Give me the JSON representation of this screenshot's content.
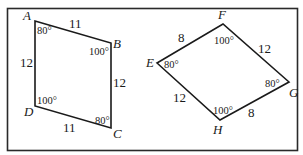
{
  "figure": {
    "colors": {
      "stroke": "#1a1a1a",
      "background": "#ffffff"
    },
    "quadrilaterals": [
      {
        "name": "ABCD",
        "vertices": [
          {
            "label": "A",
            "x": 35,
            "y": 21,
            "angle": "80°"
          },
          {
            "label": "B",
            "x": 111,
            "y": 43,
            "angle": "100°"
          },
          {
            "label": "C",
            "x": 111,
            "y": 128,
            "angle": "80°"
          },
          {
            "label": "D",
            "x": 35,
            "y": 106,
            "angle": "100°"
          }
        ],
        "sides": [
          {
            "between": "AB",
            "length": "11"
          },
          {
            "between": "BC",
            "length": "12"
          },
          {
            "between": "CD",
            "length": "11"
          },
          {
            "between": "DA",
            "length": "12"
          }
        ]
      },
      {
        "name": "EFGH",
        "vertices": [
          {
            "label": "E",
            "x": 157,
            "y": 63,
            "angle": "80°"
          },
          {
            "label": "F",
            "x": 223,
            "y": 24,
            "angle": "100°"
          },
          {
            "label": "G",
            "x": 289,
            "y": 82,
            "angle": "80°"
          },
          {
            "label": "H",
            "x": 220,
            "y": 120,
            "angle": "100°"
          }
        ],
        "sides": [
          {
            "between": "EF",
            "length": "8"
          },
          {
            "between": "FG",
            "length": "12"
          },
          {
            "between": "GH",
            "length": "8"
          },
          {
            "between": "HE",
            "length": "12"
          }
        ]
      }
    ]
  }
}
